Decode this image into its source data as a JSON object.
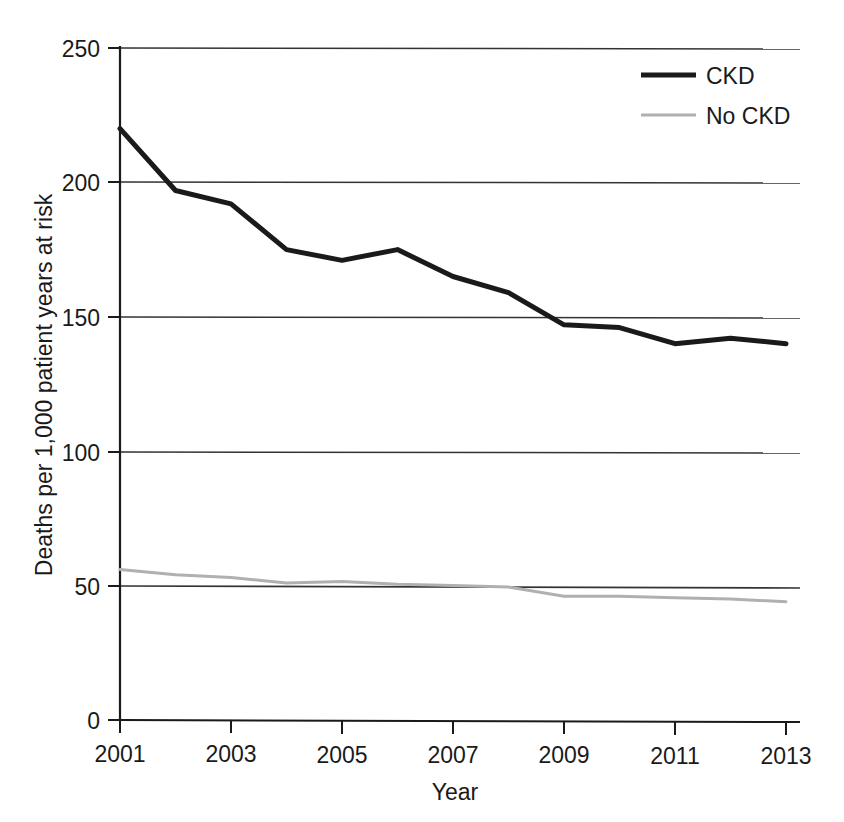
{
  "chart_data": {
    "type": "line",
    "title": "",
    "subtitle": "",
    "xlabel": "Year",
    "ylabel": "Deaths per 1,000 patient years at risk",
    "x": [
      2001,
      2002,
      2003,
      2004,
      2005,
      2006,
      2007,
      2008,
      2009,
      2010,
      2011,
      2012,
      2013
    ],
    "xlim": [
      2001,
      2013
    ],
    "ylim": [
      0,
      250
    ],
    "yticks": [
      0,
      50,
      100,
      150,
      200,
      250
    ],
    "ytick_labels": [
      "0",
      "50",
      "100",
      "150",
      "200",
      "250"
    ],
    "xticks": [
      2001,
      2003,
      2005,
      2007,
      2009,
      2011,
      2013
    ],
    "xtick_labels": [
      "2001",
      "2003",
      "2005",
      "2007",
      "2009",
      "2011",
      "2013"
    ],
    "xminor_ticks": [
      2002,
      2004,
      2006,
      2008,
      2010,
      2012
    ],
    "grid": "horizontal",
    "legend_position": "top-right",
    "series": [
      {
        "name": "CKD",
        "color": "#1a1a1a",
        "width": 5,
        "values": [
          220,
          197,
          192,
          175,
          171,
          175,
          165,
          159,
          147,
          146,
          140,
          142,
          140
        ]
      },
      {
        "name": "No CKD",
        "color": "#b0b0b0",
        "width": 3,
        "values": [
          56,
          54,
          53,
          51,
          51.5,
          50.5,
          50,
          49.5,
          46,
          46,
          45.5,
          45,
          44
        ]
      }
    ]
  },
  "legend": {
    "items": [
      {
        "label": "CKD"
      },
      {
        "label": "No CKD"
      }
    ]
  },
  "axes": {
    "x_title": "Year",
    "y_title": "Deaths per 1,000 patient years at risk"
  },
  "colors": {
    "ckd_line": "#1a1a1a",
    "no_ckd_line": "#b0b0b0",
    "axis": "#1a1a1a",
    "gridline": "#444444",
    "background": "#ffffff"
  }
}
